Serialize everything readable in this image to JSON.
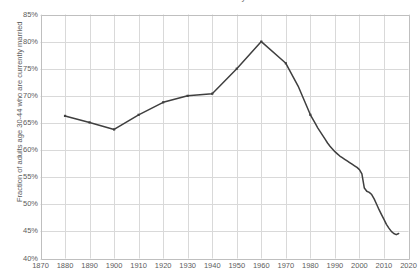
{
  "chart_data": {
    "type": "line",
    "title": "Fraction of adults currently married",
    "xlabel": "",
    "ylabel": "Fraction of adults age 30-44 who are currently married",
    "xlim": [
      1870,
      2020
    ],
    "ylim": [
      0.4,
      0.85
    ],
    "y_tick_labels": [
      "85%",
      "80%",
      "75%",
      "70%",
      "65%",
      "60%",
      "55%",
      "50%",
      "45%",
      "40%"
    ],
    "y_tick_values": [
      0.85,
      0.8,
      0.75,
      0.7,
      0.65,
      0.6,
      0.55,
      0.5,
      0.45,
      0.4
    ],
    "x_tick_labels": [
      "1870",
      "1880",
      "1890",
      "1900",
      "1910",
      "1920",
      "1930",
      "1940",
      "1950",
      "1960",
      "1970",
      "1980",
      "1990",
      "2000",
      "2010",
      "2020"
    ],
    "x_tick_values": [
      1870,
      1880,
      1890,
      1900,
      1910,
      1920,
      1930,
      1940,
      1950,
      1960,
      1970,
      1980,
      1990,
      2000,
      2010,
      2020
    ],
    "grid": true,
    "legend": "none",
    "line_color": "#3f3f3f",
    "grid_color": "#d9d9d9",
    "axis_color": "#bfbfbf",
    "series": [
      {
        "name": "Fraction currently married",
        "x": [
          1880,
          1890,
          1900,
          1910,
          1920,
          1930,
          1940,
          1950,
          1960,
          1970,
          1975,
          1980,
          1981,
          1982,
          1983,
          1984,
          1985,
          1986,
          1987,
          1988,
          1989,
          1990,
          1991,
          1992,
          1993,
          1994,
          1995,
          1996,
          1997,
          1998,
          1999,
          2000,
          2001,
          2002,
          2003,
          2004,
          2005,
          2006,
          2007,
          2008,
          2009,
          2010,
          2011,
          2012,
          2013,
          2014,
          2015,
          2016
        ],
        "values": [
          0.663,
          0.651,
          0.638,
          0.665,
          0.688,
          0.7,
          0.704,
          0.75,
          0.8,
          0.76,
          0.718,
          0.665,
          0.657,
          0.649,
          0.641,
          0.634,
          0.627,
          0.62,
          0.613,
          0.607,
          0.602,
          0.597,
          0.593,
          0.589,
          0.586,
          0.583,
          0.58,
          0.577,
          0.574,
          0.571,
          0.568,
          0.564,
          0.556,
          0.53,
          0.524,
          0.522,
          0.518,
          0.51,
          0.5,
          0.49,
          0.481,
          0.472,
          0.463,
          0.456,
          0.45,
          0.446,
          0.444,
          0.446
        ]
      }
    ]
  }
}
